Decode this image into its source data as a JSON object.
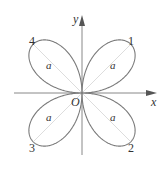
{
  "diagram": {
    "axes": {
      "x_label": "x",
      "y_label": "y",
      "origin_label": "O",
      "color": "#888888"
    },
    "lobes": [
      {
        "id": "1",
        "label": "1",
        "param_label": "a",
        "quadrant": "I"
      },
      {
        "id": "2",
        "label": "2",
        "param_label": "a",
        "quadrant": "IV"
      },
      {
        "id": "3",
        "label": "3",
        "param_label": "a",
        "quadrant": "III"
      },
      {
        "id": "4",
        "label": "4",
        "param_label": "a",
        "quadrant": "II"
      }
    ],
    "colors": {
      "curve": "#7a7a7a",
      "guide": "#dddddd",
      "text": "#333333"
    }
  }
}
